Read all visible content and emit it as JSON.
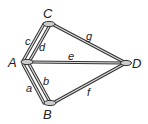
{
  "diagram": {
    "type": "graph",
    "nodes": [
      {
        "id": "A",
        "label": "A"
      },
      {
        "id": "B",
        "label": "B"
      },
      {
        "id": "C",
        "label": "C"
      },
      {
        "id": "D",
        "label": "D"
      }
    ],
    "edges": [
      {
        "id": "a",
        "label": "a",
        "from": "A",
        "to": "B"
      },
      {
        "id": "b",
        "label": "b",
        "from": "A",
        "to": "B"
      },
      {
        "id": "c",
        "label": "c",
        "from": "A",
        "to": "C"
      },
      {
        "id": "d",
        "label": "d",
        "from": "A",
        "to": "C"
      },
      {
        "id": "e",
        "label": "e",
        "from": "A",
        "to": "D"
      },
      {
        "id": "f",
        "label": "f",
        "from": "B",
        "to": "D"
      },
      {
        "id": "g",
        "label": "g",
        "from": "C",
        "to": "D"
      }
    ]
  }
}
